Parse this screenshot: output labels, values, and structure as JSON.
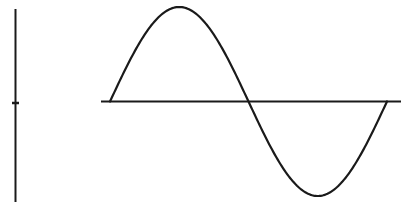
{
  "diagram": {
    "title": "",
    "stroke_color": "#1a1a1a",
    "background_color": "#ffffff",
    "wave": {
      "type": "sine",
      "cycles": 1,
      "phase": "starts at zero, positive half first"
    },
    "vertical_reference": {
      "has_midpoint_tick": true
    }
  }
}
